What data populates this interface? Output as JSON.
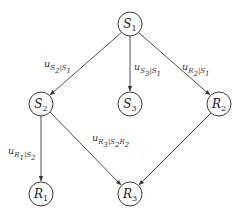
{
  "diagram": {
    "type": "directed-graph",
    "nodes": [
      {
        "id": "S1",
        "var": "S",
        "sub": "1",
        "cx": 130,
        "cy": 24
      },
      {
        "id": "S2",
        "var": "S",
        "sub": "2",
        "cx": 41,
        "cy": 104
      },
      {
        "id": "S3",
        "var": "S",
        "sub": "3",
        "cx": 130,
        "cy": 104
      },
      {
        "id": "R2",
        "var": "R",
        "sub": "2",
        "cx": 219,
        "cy": 104
      },
      {
        "id": "R1",
        "var": "R",
        "sub": "1",
        "cx": 41,
        "cy": 194
      },
      {
        "id": "R3",
        "var": "R",
        "sub": "3",
        "cx": 130,
        "cy": 194
      }
    ],
    "edges": [
      {
        "from": "S1",
        "to": "S2",
        "label": "u_{S2|S1}"
      },
      {
        "from": "S1",
        "to": "S3",
        "label": "u_{S3|S1}"
      },
      {
        "from": "S1",
        "to": "R2",
        "label": "u_{R2|S1}"
      },
      {
        "from": "S2",
        "to": "R1",
        "label": "u_{R1|S2}"
      },
      {
        "from": "S2",
        "to": "R3",
        "label": "u_{R3|S2R2}"
      },
      {
        "from": "R2",
        "to": "R3",
        "label": "u_{R3|S2R2}"
      }
    ],
    "edge_labels": [
      {
        "id": "l1",
        "base": "u",
        "sub": "S",
        "subsub": "2",
        "rest": "|S",
        "restsub": "1",
        "x": 44,
        "y": 58
      },
      {
        "id": "l2",
        "base": "u",
        "sub": "S",
        "subsub": "3",
        "rest": "|S",
        "restsub": "1",
        "x": 134,
        "y": 61
      },
      {
        "id": "l3",
        "base": "u",
        "sub": "R",
        "subsub": "2",
        "rest": "|S",
        "restsub": "1",
        "x": 182,
        "y": 61
      },
      {
        "id": "l4",
        "base": "u",
        "sub": "R",
        "subsub": "1",
        "rest": "|S",
        "restsub": "2",
        "x": 8,
        "y": 145
      },
      {
        "id": "l5",
        "base": "u",
        "sub": "R",
        "subsub": "3",
        "rest": "|S",
        "restsub": "2",
        "rest2": "R",
        "rest2sub": "2",
        "x": 92,
        "y": 132
      }
    ],
    "colors": {
      "stroke": "#3a3a3a",
      "text": "#222222",
      "background": "#ffffff"
    }
  }
}
